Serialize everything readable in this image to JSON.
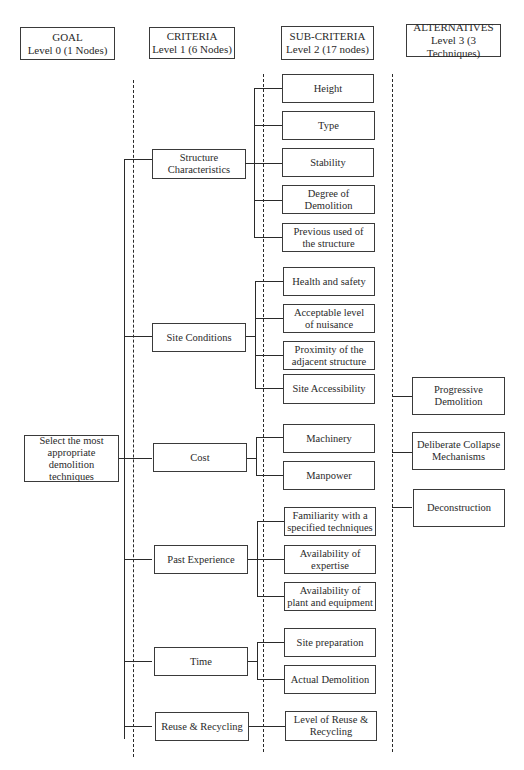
{
  "headers": {
    "goal": {
      "title": "GOAL",
      "subtitle": "Level 0 (1 Nodes)"
    },
    "criteria": {
      "title": "CRITERIA",
      "subtitle": "Level 1 (6 Nodes)"
    },
    "subcriteria": {
      "title": "SUB-CRITERIA",
      "subtitle": "Level 2 (17 nodes)"
    },
    "alternatives": {
      "title": "ALTERNATIVES",
      "subtitle": "Level 3 (3 Techniques)"
    }
  },
  "goal": {
    "line1": "Select the most",
    "line2": "appropriate",
    "line3": "demolition techniques"
  },
  "criteria": [
    {
      "line1": "Structure",
      "line2": "Characteristics"
    },
    {
      "line1": "Site Conditions",
      "line2": ""
    },
    {
      "line1": "Cost",
      "line2": ""
    },
    {
      "line1": "Past Experience",
      "line2": ""
    },
    {
      "line1": "Time",
      "line2": ""
    },
    {
      "line1": "Reuse & Recycling",
      "line2": ""
    }
  ],
  "subcriteria": [
    {
      "line1": "Height",
      "line2": ""
    },
    {
      "line1": "Type",
      "line2": ""
    },
    {
      "line1": "Stability",
      "line2": ""
    },
    {
      "line1": "Degree of Demolition",
      "line2": ""
    },
    {
      "line1": "Previous used of",
      "line2": "the structure"
    },
    {
      "line1": "Health and safety",
      "line2": ""
    },
    {
      "line1": "Acceptable level",
      "line2": "of nuisance"
    },
    {
      "line1": "Proximity of the",
      "line2": "adjacent structure"
    },
    {
      "line1": "Site Accessibility",
      "line2": ""
    },
    {
      "line1": "Machinery",
      "line2": ""
    },
    {
      "line1": "Manpower",
      "line2": ""
    },
    {
      "line1": "Familiarity with a",
      "line2": "specified techniques"
    },
    {
      "line1": "Availability of",
      "line2": "expertise"
    },
    {
      "line1": "Availability of",
      "line2": "plant and equipment"
    },
    {
      "line1": "Site preparation",
      "line2": ""
    },
    {
      "line1": "Actual Demolition",
      "line2": ""
    },
    {
      "line1": "Level of Reuse &",
      "line2": "Recycling"
    }
  ],
  "alternatives": [
    {
      "line1": "Progressive",
      "line2": "Demolition"
    },
    {
      "line1": "Deliberate Collapse",
      "line2": "Mechanisms"
    },
    {
      "line1": "Deconstruction",
      "line2": ""
    }
  ]
}
